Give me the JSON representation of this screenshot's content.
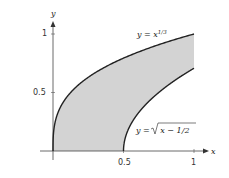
{
  "chart_data": {
    "type": "area",
    "title": "",
    "xlabel": "x",
    "ylabel": "y",
    "xlim": [
      0,
      1
    ],
    "ylim": [
      0,
      1
    ],
    "x_ticks": [
      "0.5",
      "1"
    ],
    "y_ticks": [
      "0.5",
      "1"
    ],
    "grid": false,
    "series": [
      {
        "name": "y = x^(1/3)",
        "label_text": "y = x",
        "label_sup": "1/3",
        "function": "x^(1/3)",
        "x": [
          0,
          0.125,
          0.25,
          0.5,
          0.75,
          1
        ],
        "values": [
          0,
          0.5,
          0.63,
          0.794,
          0.909,
          1
        ]
      },
      {
        "name": "y = sqrt(x - 1/2)",
        "label_text": "y = ",
        "label_rad": "x − 1/2",
        "function": "sqrt(x-0.5)",
        "x": [
          0.5,
          0.625,
          0.75,
          1
        ],
        "values": [
          0,
          0.354,
          0.5,
          0.707
        ]
      }
    ],
    "shaded_region": "between y = x^(1/3) and y = sqrt(x - 1/2) (or x-axis) for 0 ≤ x ≤ 1",
    "fill_color": "#d3d3d3",
    "curve_color": "#222222"
  }
}
